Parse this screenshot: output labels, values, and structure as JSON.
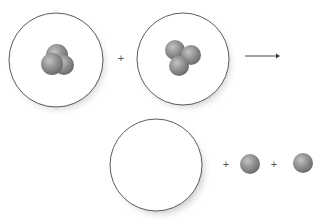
{
  "diagram": {
    "title": "",
    "colors": {
      "circle_stroke": "#4a4a4a",
      "circle_fill": "#ffffff",
      "shadow": "#c8c8c8",
      "particle_light": "#b4b4b4",
      "particle_mid": "#8e8e8e",
      "particle_dark": "#6a6a6a",
      "operator": "#555555",
      "arrow": "#333333"
    },
    "reactants": [
      {
        "name": "reactant-nucleus-1",
        "nucleon_count": 3
      },
      {
        "name": "reactant-nucleus-2",
        "nucleon_count": 3
      }
    ],
    "products": [
      {
        "name": "product-nucleus",
        "nucleon_count": 0,
        "empty": true
      },
      {
        "name": "product-particle-1",
        "nucleon_count": 1
      },
      {
        "name": "product-particle-2",
        "nucleon_count": 1
      }
    ],
    "operators": {
      "plus_1": "+",
      "plus_2": "+",
      "plus_3": "+"
    },
    "arrow": {
      "direction": "right"
    }
  }
}
